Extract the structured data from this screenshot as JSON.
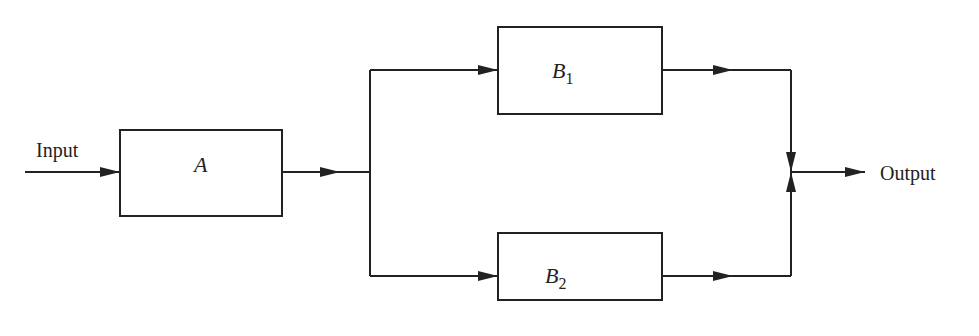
{
  "diagram": {
    "type": "block-diagram",
    "input_label": "Input",
    "output_label": "Output",
    "blocks": [
      {
        "id": "A",
        "label": "A",
        "subscript": ""
      },
      {
        "id": "B1",
        "label": "B",
        "subscript": "1"
      },
      {
        "id": "B2",
        "label": "B",
        "subscript": "2"
      }
    ],
    "connections": [
      {
        "from": "Input",
        "to": "A"
      },
      {
        "from": "A",
        "to": "B1"
      },
      {
        "from": "A",
        "to": "B2"
      },
      {
        "from": "B1",
        "to": "Output"
      },
      {
        "from": "B2",
        "to": "Output"
      }
    ],
    "colors": {
      "stroke": "#222222",
      "background": "#ffffff"
    }
  }
}
